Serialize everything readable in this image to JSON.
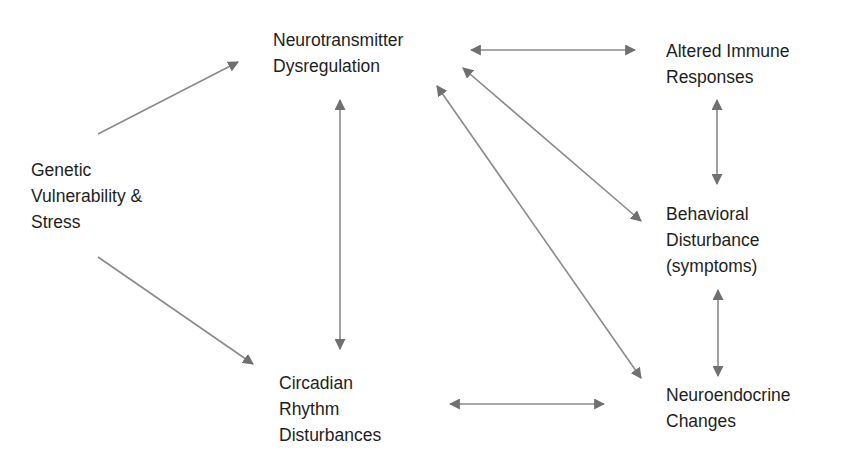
{
  "diagram": {
    "nodes": [
      {
        "id": "genetic",
        "lines": [
          "Genetic",
          "Vulnerability &",
          "Stress"
        ],
        "x": 31,
        "y": 157
      },
      {
        "id": "neurotransmitter",
        "lines": [
          "Neurotransmitter",
          "Dysregulation"
        ],
        "x": 273,
        "y": 27
      },
      {
        "id": "immune",
        "lines": [
          "Altered Immune",
          "Responses"
        ],
        "x": 666,
        "y": 40
      },
      {
        "id": "behavioral",
        "lines": [
          "Behavioral",
          "Disturbance",
          "(symptoms)"
        ],
        "x": 666,
        "y": 202
      },
      {
        "id": "circadian",
        "lines": [
          "Circadian",
          "Rhythm",
          "Disturbances"
        ],
        "x": 279,
        "y": 371
      },
      {
        "id": "neuroendocrine",
        "lines": [
          "Neuroendocrine",
          "Changes"
        ],
        "x": 666,
        "y": 384
      }
    ],
    "edges": [
      {
        "from": "genetic",
        "to": "neurotransmitter",
        "direction": "forward"
      },
      {
        "from": "genetic",
        "to": "circadian",
        "direction": "forward"
      },
      {
        "from": "neurotransmitter",
        "to": "circadian",
        "direction": "both"
      },
      {
        "from": "neurotransmitter",
        "to": "immune",
        "direction": "both"
      },
      {
        "from": "neurotransmitter",
        "to": "behavioral",
        "direction": "both"
      },
      {
        "from": "neurotransmitter",
        "to": "neuroendocrine",
        "direction": "both"
      },
      {
        "from": "immune",
        "to": "behavioral",
        "direction": "both"
      },
      {
        "from": "behavioral",
        "to": "neuroendocrine",
        "direction": "both"
      },
      {
        "from": "circadian",
        "to": "neuroendocrine",
        "direction": "both"
      }
    ],
    "colors": {
      "text": "#1e1e1e",
      "arrow": "#777777",
      "background": "#ffffff"
    }
  }
}
